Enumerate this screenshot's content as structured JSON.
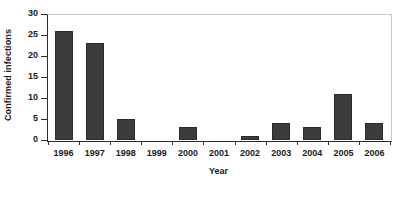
{
  "chart_data": {
    "type": "bar",
    "title": "",
    "xlabel": "Year",
    "ylabel": "Confirmed infections",
    "categories": [
      "1996",
      "1997",
      "1998",
      "1999",
      "2000",
      "2001",
      "2002",
      "2003",
      "2004",
      "2005",
      "2006"
    ],
    "values": [
      26,
      23,
      5,
      0,
      3,
      0,
      1,
      4,
      3,
      11,
      4
    ],
    "ylim": [
      0,
      30
    ],
    "ytick_labels": [
      "0",
      "5",
      "10",
      "15",
      "20",
      "25",
      "30"
    ],
    "ytick_values": [
      0,
      5,
      10,
      15,
      20,
      25,
      30
    ],
    "grid": false,
    "legend": null,
    "bar_color": "#3c3c3c",
    "axis_color": "#2b2b2b",
    "frame_color": "#c8c8c8",
    "background": "#ffffff"
  }
}
